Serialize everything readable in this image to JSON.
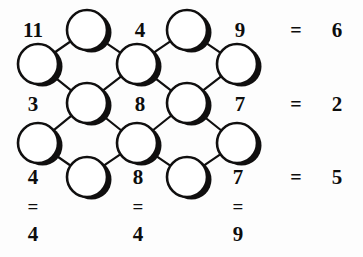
{
  "puzzle": {
    "type": "number-lattice-equation-grid",
    "title": "Number lattice puzzle",
    "colors": {
      "ink": "#100f0f",
      "background": "#ffffff",
      "node_fill": "#ffffff"
    },
    "cell_labels": [
      {
        "id": "cell-r1-c1",
        "value": "11",
        "x": 33,
        "y": 30,
        "row": 1,
        "col": 1
      },
      {
        "id": "cell-r1-c2",
        "value": "4",
        "x": 140,
        "y": 30,
        "row": 1,
        "col": 2
      },
      {
        "id": "cell-r1-c3",
        "value": "9",
        "x": 240,
        "y": 30,
        "row": 1,
        "col": 3
      },
      {
        "id": "cell-r2-c1",
        "value": "3",
        "x": 33,
        "y": 104,
        "row": 2,
        "col": 1
      },
      {
        "id": "cell-r2-c2",
        "value": "8",
        "x": 140,
        "y": 104,
        "row": 2,
        "col": 2
      },
      {
        "id": "cell-r2-c3",
        "value": "7",
        "x": 240,
        "y": 104,
        "row": 2,
        "col": 3
      },
      {
        "id": "cell-r3-c1",
        "value": "4",
        "x": 33,
        "y": 177,
        "row": 3,
        "col": 1
      },
      {
        "id": "cell-r3-c2",
        "value": "8",
        "x": 138,
        "y": 177,
        "row": 3,
        "col": 2
      },
      {
        "id": "cell-r3-c3",
        "value": "7",
        "x": 238,
        "y": 177,
        "row": 3,
        "col": 3
      }
    ],
    "row_equations": [
      {
        "id": "row-1",
        "equals": "=",
        "result": "6",
        "eq_x": 296,
        "result_x": 337,
        "y": 30
      },
      {
        "id": "row-2",
        "equals": "=",
        "result": "2",
        "eq_x": 296,
        "result_x": 337,
        "y": 104
      },
      {
        "id": "row-3",
        "equals": "=",
        "result": "5",
        "eq_x": 296,
        "result_x": 337,
        "y": 177
      }
    ],
    "column_equations": [
      {
        "id": "col-1",
        "equals": "=",
        "result": "4",
        "x": 33,
        "eq_y": 206,
        "result_y": 234
      },
      {
        "id": "col-2",
        "equals": "=",
        "result": "4",
        "x": 138,
        "eq_y": 206,
        "result_y": 234
      },
      {
        "id": "col-3",
        "equals": "=",
        "result": "9",
        "x": 238,
        "eq_y": 206,
        "result_y": 234
      }
    ],
    "nodes": [
      {
        "id": "node-1",
        "cx": 87,
        "cy": 30,
        "r": 20
      },
      {
        "id": "node-2",
        "cx": 187,
        "cy": 30,
        "r": 20
      },
      {
        "id": "node-3",
        "cx": 38,
        "cy": 64,
        "r": 20
      },
      {
        "id": "node-4",
        "cx": 137,
        "cy": 64,
        "r": 20
      },
      {
        "id": "node-5",
        "cx": 237,
        "cy": 64,
        "r": 20
      },
      {
        "id": "node-6",
        "cx": 87,
        "cy": 103,
        "r": 20
      },
      {
        "id": "node-7",
        "cx": 187,
        "cy": 103,
        "r": 20
      },
      {
        "id": "node-8",
        "cx": 38,
        "cy": 143,
        "r": 20
      },
      {
        "id": "node-9",
        "cx": 137,
        "cy": 143,
        "r": 20
      },
      {
        "id": "node-10",
        "cx": 237,
        "cy": 143,
        "r": 20
      },
      {
        "id": "node-11",
        "cx": 87,
        "cy": 177,
        "r": 20
      },
      {
        "id": "node-12",
        "cx": 187,
        "cy": 177,
        "r": 20
      }
    ],
    "edges": [
      {
        "from": "node-1",
        "to": "node-3"
      },
      {
        "from": "node-1",
        "to": "node-4"
      },
      {
        "from": "node-2",
        "to": "node-4"
      },
      {
        "from": "node-2",
        "to": "node-5"
      },
      {
        "from": "node-3",
        "to": "node-6"
      },
      {
        "from": "node-4",
        "to": "node-6"
      },
      {
        "from": "node-4",
        "to": "node-7"
      },
      {
        "from": "node-5",
        "to": "node-7"
      },
      {
        "from": "node-6",
        "to": "node-8"
      },
      {
        "from": "node-6",
        "to": "node-9"
      },
      {
        "from": "node-7",
        "to": "node-9"
      },
      {
        "from": "node-7",
        "to": "node-10"
      },
      {
        "from": "node-8",
        "to": "node-11"
      },
      {
        "from": "node-9",
        "to": "node-11"
      },
      {
        "from": "node-9",
        "to": "node-12"
      },
      {
        "from": "node-10",
        "to": "node-12"
      }
    ]
  }
}
